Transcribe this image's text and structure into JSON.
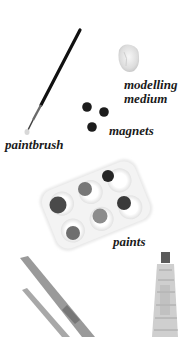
{
  "labels": {
    "top_cut": "",
    "modelling": "modelling",
    "medium": "medium",
    "magnets": "magnets",
    "paintbrush": "paintbrush",
    "paints": "paints"
  },
  "items": [
    {
      "name": "paintbrush",
      "icon": "paintbrush-icon"
    },
    {
      "name": "modelling medium",
      "icon": "clay-lump-icon"
    },
    {
      "name": "magnets",
      "icon": "magnet-dots-icon",
      "count": 3
    },
    {
      "name": "paints",
      "icon": "paint-palette-icon",
      "wells": 6
    },
    {
      "name": "craft knives",
      "icon": "blade-icon"
    },
    {
      "name": "glue tube",
      "icon": "tube-icon"
    }
  ],
  "colors": {
    "background": "#ffffff",
    "ink": "#1a1a1a",
    "palette_tray": "#ececec",
    "paint_dark": "#2e2e2e",
    "paint_mid": "#6a6a6a",
    "paint_light": "#8a8a8a"
  }
}
